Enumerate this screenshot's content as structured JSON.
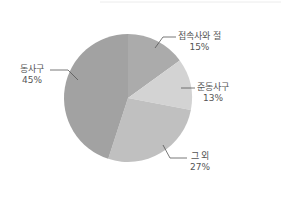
{
  "chart_data": {
    "type": "pie",
    "title": "",
    "categories": [
      "접속사와 절",
      "준동사구",
      "그 외",
      "동사구"
    ],
    "values": [
      15,
      13,
      27,
      45
    ],
    "labels": [
      "15%",
      "13%",
      "27%",
      "45%"
    ],
    "colors": [
      "#ababab",
      "#d3d3d3",
      "#c0c0c0",
      "#a2a2a2"
    ],
    "start_angle_deg": 0,
    "direction": "clockwise",
    "legend": "none (leader-line labels)"
  },
  "labels": {
    "s0": {
      "name": "접속사와 절",
      "pct": "15%"
    },
    "s1": {
      "name": "준동사구",
      "pct": "13%"
    },
    "s2": {
      "name": "그 외",
      "pct": "27%"
    },
    "s3": {
      "name": "동사구",
      "pct": "45%"
    }
  }
}
